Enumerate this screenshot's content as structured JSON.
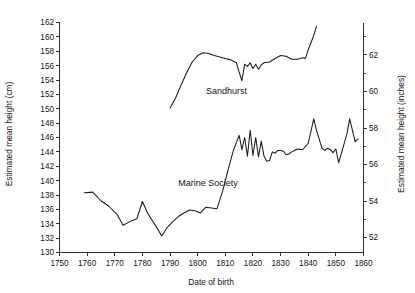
{
  "chart_data": {
    "type": "line",
    "title": "",
    "xlabel": "Date of birth",
    "ylabel": "Estimated mean height (cm)",
    "ylabel_right": "Estimated mean height (inches)",
    "xlim": [
      1750,
      1860
    ],
    "ylim": [
      130,
      162
    ],
    "ylim_right": [
      51.18,
      63.78
    ],
    "xticks": [
      1750,
      1760,
      1770,
      1780,
      1790,
      1800,
      1810,
      1820,
      1830,
      1840,
      1850,
      1860
    ],
    "yticks": [
      130,
      132,
      134,
      136,
      138,
      140,
      142,
      144,
      146,
      148,
      150,
      152,
      154,
      156,
      158,
      160,
      162
    ],
    "yticks_right": [
      52,
      54,
      56,
      58,
      60,
      62
    ],
    "yticks_right_minor": [
      53,
      55,
      57,
      59,
      61,
      63
    ],
    "grid": false,
    "legend_position": "inline-annotation",
    "series": [
      {
        "name": "Marine Society",
        "label_x": 1793,
        "label_y": 139.2,
        "points": [
          [
            1759,
            138.3
          ],
          [
            1762,
            138.4
          ],
          [
            1765,
            137.2
          ],
          [
            1768,
            136.4
          ],
          [
            1771,
            135.2
          ],
          [
            1773,
            133.8
          ],
          [
            1776,
            134.4
          ],
          [
            1778,
            134.7
          ],
          [
            1780,
            137.1
          ],
          [
            1782,
            135.4
          ],
          [
            1785,
            133.6
          ],
          [
            1787,
            132.3
          ],
          [
            1789,
            133.5
          ],
          [
            1791,
            134.3
          ],
          [
            1793,
            135.0
          ],
          [
            1795,
            135.5
          ],
          [
            1797,
            135.9
          ],
          [
            1799,
            135.8
          ],
          [
            1801,
            135.5
          ],
          [
            1803,
            136.3
          ],
          [
            1805,
            136.2
          ],
          [
            1807,
            136.1
          ],
          [
            1809,
            138.5
          ],
          [
            1811,
            141.5
          ],
          [
            1813,
            144.3
          ],
          [
            1815,
            146.3
          ],
          [
            1816,
            144.3
          ],
          [
            1817,
            146.0
          ],
          [
            1818,
            143.4
          ],
          [
            1819,
            147.0
          ],
          [
            1820,
            143.5
          ],
          [
            1821,
            146.0
          ],
          [
            1822,
            143.3
          ],
          [
            1823,
            145.5
          ],
          [
            1824,
            143.4
          ],
          [
            1825,
            142.7
          ],
          [
            1826,
            142.8
          ],
          [
            1827,
            144.0
          ],
          [
            1828,
            143.8
          ],
          [
            1829,
            144.2
          ],
          [
            1830,
            144.2
          ],
          [
            1831,
            144.1
          ],
          [
            1832,
            143.6
          ],
          [
            1833,
            143.7
          ],
          [
            1834,
            144.0
          ],
          [
            1835,
            144.2
          ],
          [
            1836,
            144.4
          ],
          [
            1838,
            144.3
          ],
          [
            1840,
            145.2
          ],
          [
            1842,
            148.6
          ],
          [
            1843,
            147.0
          ],
          [
            1845,
            144.5
          ],
          [
            1846,
            144.2
          ],
          [
            1847,
            144.5
          ],
          [
            1848,
            144.3
          ],
          [
            1849,
            143.9
          ],
          [
            1850,
            144.4
          ],
          [
            1851,
            142.5
          ],
          [
            1852,
            143.8
          ],
          [
            1854,
            146.5
          ],
          [
            1855,
            148.6
          ],
          [
            1856,
            147.0
          ],
          [
            1857,
            145.4
          ],
          [
            1858,
            145.8
          ]
        ]
      },
      {
        "name": "Sandhurst",
        "label_x": 1803,
        "label_y": 152.0,
        "points": [
          [
            1790,
            150.1
          ],
          [
            1792,
            151.5
          ],
          [
            1794,
            153.3
          ],
          [
            1796,
            155.0
          ],
          [
            1798,
            156.5
          ],
          [
            1800,
            157.4
          ],
          [
            1802,
            157.8
          ],
          [
            1804,
            157.7
          ],
          [
            1806,
            157.4
          ],
          [
            1808,
            157.2
          ],
          [
            1810,
            157.0
          ],
          [
            1812,
            156.8
          ],
          [
            1814,
            156.4
          ],
          [
            1815,
            155.1
          ],
          [
            1816,
            153.9
          ],
          [
            1817,
            156.2
          ],
          [
            1818,
            155.9
          ],
          [
            1819,
            156.4
          ],
          [
            1820,
            155.6
          ],
          [
            1821,
            156.2
          ],
          [
            1822,
            155.5
          ],
          [
            1823,
            156.1
          ],
          [
            1824,
            156.4
          ],
          [
            1826,
            156.5
          ],
          [
            1828,
            157.0
          ],
          [
            1830,
            157.4
          ],
          [
            1832,
            157.3
          ],
          [
            1834,
            156.9
          ],
          [
            1836,
            156.9
          ],
          [
            1838,
            157.1
          ],
          [
            1839,
            157.0
          ],
          [
            1840,
            158.2
          ],
          [
            1842,
            160.2
          ],
          [
            1843,
            161.5
          ]
        ]
      }
    ]
  },
  "axes": {
    "left_title": "Estimated mean height (cm)",
    "right_title": "Estimated mean height (inches)",
    "bottom_title": "Date of birth"
  },
  "annotations": {
    "sandhurst_label": "Sandhurst",
    "marine_society_label": "Marine Society"
  },
  "colors": {
    "line": "#1a1a1a",
    "text": "#141414",
    "background": "#ffffff"
  }
}
